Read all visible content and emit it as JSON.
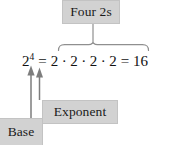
{
  "figure": {
    "type": "exponent-annotation-diagram",
    "background_color": "#ffffff",
    "label_box_color": "#d2d2d2",
    "ink_color": "#111111",
    "rule_color": "#8a8a8a"
  },
  "equation": {
    "base": "2",
    "exponent": "4",
    "equals_1": "=",
    "factors": [
      "2",
      "2",
      "2",
      "2"
    ],
    "multiplication_dot": "·",
    "equals_2": "=",
    "result": "16",
    "full_text": "2⁴ = 2 · 2 · 2 · 2 = 16"
  },
  "callouts": {
    "top": {
      "label": "Four 2s",
      "points_to": "the four factors of 2 in the product",
      "connector": "stem-and-horizontal-brace"
    },
    "exponent": {
      "label": "Exponent",
      "points_to": "the superscript 4",
      "connector": "up-arrow"
    },
    "base": {
      "label": "Base",
      "points_to": "the numeral 2",
      "connector": "up-arrow"
    }
  },
  "icons": {
    "arrow_up": "arrow-up-icon",
    "brace": "curly-brace-icon",
    "stem": "connector-line-icon"
  }
}
